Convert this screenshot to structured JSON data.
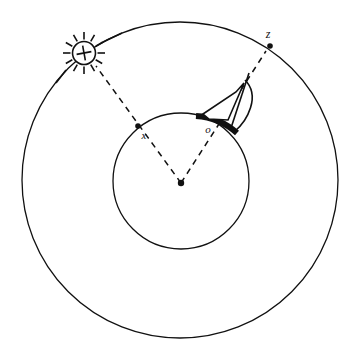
{
  "figure": {
    "background_color": "#ffffff",
    "stroke_color": "#111111",
    "canvas": {
      "width": 358,
      "height": 358
    }
  },
  "circles": {
    "outer": {
      "name": "celestial-sphere",
      "cx": 180,
      "cy": 180,
      "r": 158,
      "stroke_width": 1.3,
      "style": "solid"
    },
    "inner": {
      "name": "earth",
      "cx": 181,
      "cy": 181,
      "r": 68,
      "stroke_width": 1.3,
      "style": "solid"
    }
  },
  "center_point": {
    "label": "",
    "cx": 181,
    "cy": 183,
    "r": 3.2
  },
  "points": [
    {
      "id": "x",
      "label": "x",
      "label_x": 144,
      "label_y": 139,
      "cx": 138,
      "cy": 126,
      "r": 2.8,
      "on": "inner-circle"
    },
    {
      "id": "o",
      "label": "o",
      "label_x": 208,
      "label_y": 133,
      "cx": 212,
      "cy": 121,
      "r": 0,
      "on": "inner-circle"
    },
    {
      "id": "z",
      "label": "z",
      "label_x": 268,
      "label_y": 38,
      "cx": 270,
      "cy": 46,
      "r": 2.8,
      "on": "outer-circle"
    }
  ],
  "sun": {
    "name": "sun-symbol",
    "cx": 84,
    "cy": 53,
    "disc_r": 11.5,
    "ray_inner": 13.5,
    "ray_outer": 21,
    "ray_count": 12,
    "cross_arm": 7.5,
    "stroke_width": 1.6
  },
  "dashed_lines": [
    {
      "name": "center-to-sun-ray",
      "from": {
        "x": 181,
        "y": 183
      },
      "to": {
        "x": 96,
        "y": 66
      },
      "dash": "6 5"
    },
    {
      "name": "center-to-zenith-ray",
      "from": {
        "x": 181,
        "y": 183
      },
      "to": {
        "x": 266,
        "y": 51
      },
      "dash": "6 5"
    }
  ],
  "sun_rays_external": [
    {
      "name": "sun-ray-upper-right",
      "from": {
        "x": 101,
        "y": 43
      },
      "to": {
        "x": 122,
        "y": 33
      }
    },
    {
      "name": "sun-ray-lower-left",
      "from": {
        "x": 66,
        "y": 70
      },
      "to": {
        "x": 56,
        "y": 83
      }
    }
  ],
  "instrument": {
    "name": "quadrant-sail",
    "description": "sail-shaped quadrant instrument resting on the inner circle at the observer",
    "base_arc": {
      "name": "thick-horizon-arc",
      "start": {
        "x": 196,
        "y": 116
      },
      "end": {
        "x": 237,
        "y": 133
      },
      "radius": 68,
      "stroke_width": 6
    },
    "sail_outline": [
      {
        "x": 203,
        "y": 114
      },
      {
        "x": 236,
        "y": 92
      },
      {
        "x": 244,
        "y": 83
      },
      {
        "x": 228,
        "y": 120
      },
      {
        "x": 209,
        "y": 119
      }
    ],
    "mast": {
      "from": {
        "x": 249,
        "y": 73
      },
      "to": {
        "x": 231,
        "y": 128
      }
    },
    "curved_edge": {
      "from": {
        "x": 245,
        "y": 80
      },
      "to": {
        "x": 235,
        "y": 131
      }
    },
    "stroke_width": 1.6
  },
  "labels": {
    "x_label": "x",
    "o_label": "o",
    "z_label": "z"
  }
}
